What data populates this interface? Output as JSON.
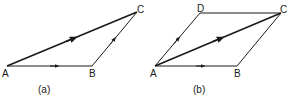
{
  "figures": [
    {
      "id": "a",
      "caption": "(a)",
      "points": {
        "A": {
          "label": "A",
          "x": 7,
          "y": 66
        },
        "B": {
          "label": "B",
          "x": 92,
          "y": 66
        },
        "C": {
          "label": "C",
          "x": 137,
          "y": 12
        }
      },
      "vectors": [
        "AB",
        "BC",
        "AC"
      ],
      "description": "Triangle law of vector addition: AB + BC = AC"
    },
    {
      "id": "b",
      "caption": "(b)",
      "points": {
        "A": {
          "label": "A",
          "x": 155,
          "y": 66
        },
        "B": {
          "label": "B",
          "x": 237,
          "y": 66
        },
        "C": {
          "label": "C",
          "x": 281,
          "y": 13
        },
        "D": {
          "label": "D",
          "x": 200,
          "y": 13
        }
      },
      "vectors": [
        "AB",
        "AD",
        "AC"
      ],
      "plain_edges": [
        "DC",
        "BC"
      ],
      "description": "Parallelogram law of vector addition: AB + AD = AC"
    }
  ],
  "colors": {
    "stroke": "#1a1a1a",
    "background": "#ffffff"
  }
}
